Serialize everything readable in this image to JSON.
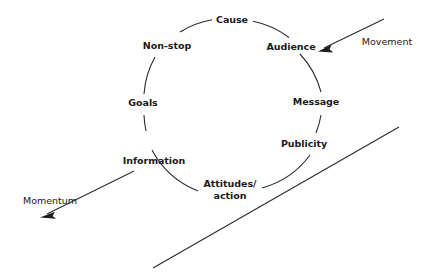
{
  "diagram": {
    "type": "cycle-diagram",
    "title": "",
    "background_color": "#ffffff",
    "line_color": "#2b2b2b",
    "text_color": "#1a1a1a",
    "cycle": {
      "shape": "circle",
      "center_x": 233,
      "center_y": 107,
      "radius": 89,
      "direction": "clockwise",
      "nodes": [
        {
          "label": "Cause",
          "position": "top",
          "angle_deg": 270,
          "x": 232,
          "y": 19,
          "lines": 1
        },
        {
          "label": "Audience",
          "position": "upper-right",
          "angle_deg": 315,
          "x": 291,
          "y": 46,
          "lines": 1
        },
        {
          "label": "Message",
          "position": "right",
          "angle_deg": 0,
          "x": 316,
          "y": 101,
          "lines": 1
        },
        {
          "label": "Publicity",
          "position": "lower-right",
          "angle_deg": 35,
          "x": 304,
          "y": 143,
          "lines": 1
        },
        {
          "label": "Attitudes/",
          "label_line2": "action",
          "position": "bottom",
          "angle_deg": 90,
          "x": 230,
          "y": 189,
          "lines": 2
        },
        {
          "label": "Information",
          "position": "lower-left",
          "angle_deg": 145,
          "x": 154,
          "y": 160,
          "lines": 1
        },
        {
          "label": "Goals",
          "position": "left",
          "angle_deg": 180,
          "x": 143,
          "y": 102,
          "lines": 1
        },
        {
          "label": "Non-stop",
          "position": "upper-left",
          "angle_deg": 225,
          "x": 167,
          "y": 45,
          "lines": 1
        }
      ]
    },
    "arrows": [
      {
        "label": "Movement",
        "label_x": 387,
        "label_y": 41,
        "from_x": 384,
        "from_y": 19,
        "to_x": 320,
        "to_y": 50,
        "has_arrowhead": true,
        "direction": "down-left",
        "points_to": "cycle"
      },
      {
        "label": "Momentum",
        "label_x": 50,
        "label_y": 200,
        "from_x": 134,
        "from_y": 171,
        "to_x": 41,
        "to_y": 217,
        "has_arrowhead": true,
        "direction": "down-left",
        "points_to": "away-from-cycle"
      }
    ],
    "lines": [
      {
        "name": "baseline-diagonal",
        "from_x": 153,
        "from_y": 268,
        "to_x": 399,
        "to_y": 127,
        "has_arrowhead": false
      }
    ]
  }
}
